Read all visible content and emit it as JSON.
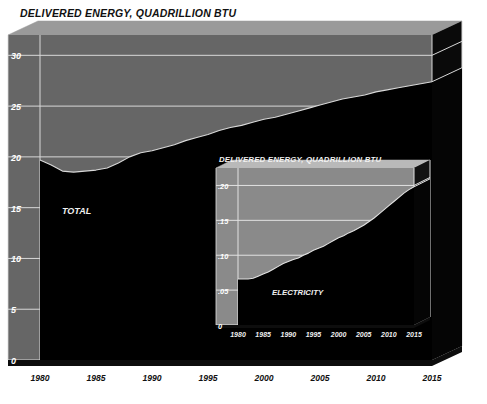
{
  "page": {
    "background_color": "#ffffff",
    "width": 487,
    "height": 404
  },
  "main_chart": {
    "title": "DELIVERED ENERGY, QUADRILLION BTU",
    "series_label": "TOTAL",
    "colors": {
      "wall": "#666666",
      "wall_top_bevel": "#9a9a9a",
      "wall_side_dark": "#0a0a0a",
      "area_fill": "#000000",
      "gridline": "#d8d8d8",
      "axis_text": "#ffffff",
      "tick_text": "#1a1a1a",
      "title_text": "#111111"
    },
    "y_ticks": [
      "0",
      "5",
      "10",
      "15",
      "20",
      "25",
      "30"
    ],
    "x_ticks": [
      "1980",
      "1985",
      "1990",
      "1995",
      "2000",
      "2005",
      "2010",
      "2015"
    ]
  },
  "inset_chart": {
    "title": "DELIVERED ENERGY, QUADRILLION BTU",
    "series_label": "ELECTRICITY",
    "y_ticks": [
      "0",
      ".05",
      ".10",
      ".15",
      ".20"
    ],
    "x_ticks": [
      "1980",
      "1985",
      "1990",
      "1995",
      "2000",
      "2005",
      "2010",
      "2015"
    ]
  },
  "chart_data": [
    {
      "type": "area",
      "id": "main",
      "title": "DELIVERED ENERGY, QUADRILLION BTU",
      "xlabel": "",
      "ylabel": "DELIVERED ENERGY, QUADRILLION BTU",
      "series_name": "TOTAL",
      "xlim": [
        1980,
        2015
      ],
      "ylim": [
        0,
        32
      ],
      "ytick_values": [
        0,
        5,
        10,
        15,
        20,
        25,
        30
      ],
      "ytick_labels": [
        "0",
        "5",
        "10",
        "15",
        "20",
        "25",
        "30"
      ],
      "xtick_values": [
        1980,
        1985,
        1990,
        1995,
        2000,
        2005,
        2010,
        2015
      ],
      "xtick_labels": [
        "1980",
        "1985",
        "1990",
        "1995",
        "2000",
        "2005",
        "2010",
        "2015"
      ],
      "grid": true,
      "legend": "none",
      "annotations": [
        "TOTAL"
      ],
      "x": [
        1980,
        1981,
        1982,
        1983,
        1984,
        1985,
        1986,
        1987,
        1988,
        1989,
        1990,
        1991,
        1992,
        1993,
        1994,
        1995,
        1996,
        1997,
        1998,
        1999,
        2000,
        2001,
        2002,
        2003,
        2004,
        2005,
        2006,
        2007,
        2008,
        2009,
        2010,
        2011,
        2012,
        2013,
        2014,
        2015
      ],
      "values": [
        19.7,
        19.2,
        18.6,
        18.5,
        18.6,
        18.7,
        18.9,
        19.4,
        20.0,
        20.4,
        20.6,
        20.9,
        21.2,
        21.6,
        21.9,
        22.2,
        22.6,
        22.9,
        23.1,
        23.4,
        23.7,
        23.9,
        24.2,
        24.5,
        24.8,
        25.1,
        25.4,
        25.7,
        25.9,
        26.1,
        26.4,
        26.6,
        26.8,
        27.0,
        27.2,
        27.4
      ]
    },
    {
      "type": "area",
      "id": "inset",
      "title": "DELIVERED ENERGY, QUADRILLION BTU",
      "xlabel": "",
      "ylabel": "DELIVERED ENERGY, QUADRILLION BTU",
      "series_name": "ELECTRICITY",
      "xlim": [
        1980,
        2015
      ],
      "ylim": [
        0,
        0.225
      ],
      "ytick_values": [
        0,
        0.05,
        0.1,
        0.15,
        0.2
      ],
      "ytick_labels": [
        "0",
        ".05",
        ".10",
        ".15",
        ".20"
      ],
      "xtick_values": [
        1980,
        1985,
        1990,
        1995,
        2000,
        2005,
        2010,
        2015
      ],
      "xtick_labels": [
        "1980",
        "1985",
        "1990",
        "1995",
        "2000",
        "2005",
        "2010",
        "2015"
      ],
      "grid": true,
      "legend": "none",
      "annotations": [
        "ELECTRICITY"
      ],
      "x": [
        1980,
        1981,
        1982,
        1983,
        1984,
        1985,
        1986,
        1987,
        1988,
        1989,
        1990,
        1991,
        1992,
        1993,
        1994,
        1995,
        1996,
        1997,
        1998,
        1999,
        2000,
        2001,
        2002,
        2003,
        2004,
        2005,
        2006,
        2007,
        2008,
        2009,
        2010,
        2011,
        2012,
        2013,
        2014,
        2015
      ],
      "values": [
        0.066,
        0.066,
        0.066,
        0.067,
        0.07,
        0.073,
        0.076,
        0.08,
        0.084,
        0.088,
        0.091,
        0.094,
        0.096,
        0.1,
        0.103,
        0.107,
        0.11,
        0.113,
        0.117,
        0.121,
        0.125,
        0.128,
        0.132,
        0.135,
        0.139,
        0.143,
        0.148,
        0.153,
        0.159,
        0.165,
        0.171,
        0.177,
        0.183,
        0.189,
        0.194,
        0.198
      ]
    }
  ]
}
